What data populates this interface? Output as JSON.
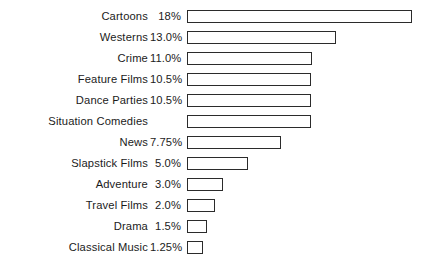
{
  "chart_data": {
    "type": "bar",
    "orientation": "horizontal",
    "title": "",
    "subtitle": "",
    "xlabel": "",
    "ylabel": "",
    "grid": false,
    "legend": null,
    "axis_visible": false,
    "value_unit": "percent",
    "xlim": [
      0,
      18
    ],
    "categories": [
      "Cartoons",
      "Westerns",
      "Crime",
      "Feature Films",
      "Dance Parties",
      "Situation Comedies",
      "News",
      "Slapstick Films",
      "Adventure",
      "Travel Films",
      "Drama",
      "Classical Music"
    ],
    "values": [
      18,
      13.0,
      11.0,
      10.5,
      10.5,
      10.0,
      7.75,
      5.0,
      3.0,
      2.0,
      1.5,
      1.25
    ],
    "value_labels": [
      "18%",
      "13.0%",
      "11.0%",
      "10.5%",
      "10.5%",
      "",
      "7.75%",
      "5.0%",
      "3.0%",
      "2.0%",
      "1.5%",
      "1.25%"
    ],
    "bar_pixel_widths": [
      225,
      149,
      125,
      124,
      124,
      124,
      94,
      61,
      36,
      28,
      20,
      16
    ],
    "bar_style": {
      "fill": "#ffffff",
      "border_color": "#2b2b2b",
      "border_width_px": 1.6
    },
    "background": "#ffffff",
    "text_color": "#1b1b1b"
  },
  "rows": [
    {
      "label": "Cartoons",
      "value_label": "18%",
      "bar_width": 225
    },
    {
      "label": "Westerns",
      "value_label": "13.0%",
      "bar_width": 149
    },
    {
      "label": "Crime",
      "value_label": "11.0%",
      "bar_width": 125
    },
    {
      "label": "Feature Films",
      "value_label": "10.5%",
      "bar_width": 124
    },
    {
      "label": "Dance Parties",
      "value_label": "10.5%",
      "bar_width": 124
    },
    {
      "label": "Situation Comedies",
      "value_label": "",
      "bar_width": 124
    },
    {
      "label": "News",
      "value_label": "7.75%",
      "bar_width": 94
    },
    {
      "label": "Slapstick Films",
      "value_label": "5.0%",
      "bar_width": 61
    },
    {
      "label": "Adventure",
      "value_label": "3.0%",
      "bar_width": 36
    },
    {
      "label": "Travel Films",
      "value_label": "2.0%",
      "bar_width": 28
    },
    {
      "label": "Drama",
      "value_label": "1.5%",
      "bar_width": 20
    },
    {
      "label": "Classical Music",
      "value_label": "1.25%",
      "bar_width": 16
    }
  ]
}
